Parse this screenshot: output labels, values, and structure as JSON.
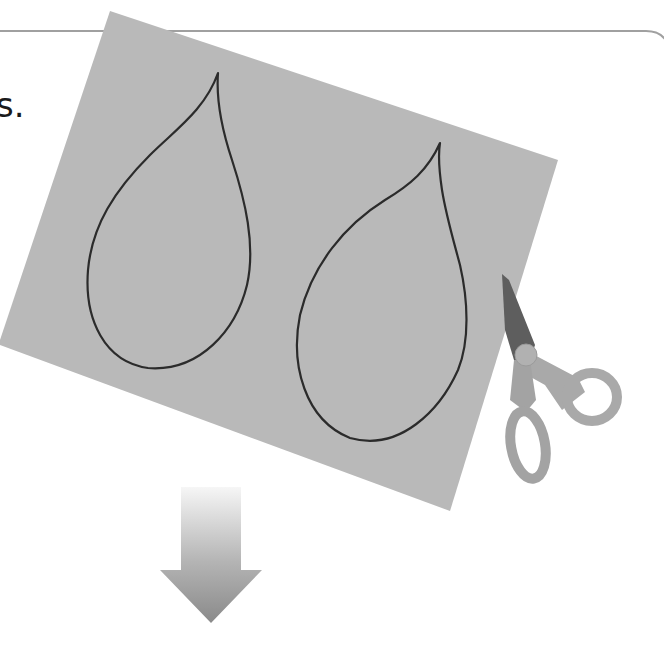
{
  "page": {
    "step_text_fragment": "s.",
    "frame": {
      "border_color": "#a0a0a0"
    }
  },
  "illustration": {
    "paper": {
      "label": "paper-with-drawn-leaf-shapes",
      "color": "#b9b9b9",
      "leaves": [
        {
          "name": "left-leaf-outline"
        },
        {
          "name": "right-leaf-outline"
        }
      ],
      "outline_color": "#2b2b2b"
    },
    "scissors": {
      "label": "scissors",
      "handle_color": "#a8a8a8",
      "blade_color": "#5e5e5e"
    },
    "arrow": {
      "label": "down-arrow",
      "direction": "down",
      "color_top": "#f4f4f4",
      "color_bottom": "#8e8e8e"
    }
  }
}
